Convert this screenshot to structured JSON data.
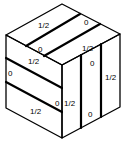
{
  "diagram": {
    "type": "isometric-cube",
    "stroke_color": "#000000",
    "background": "#ffffff",
    "faces": {
      "top": {
        "labels": [
          {
            "text": "1/2",
            "x": 38,
            "y": 28
          },
          {
            "text": "0",
            "x": 84,
            "y": 25
          },
          {
            "text": "0",
            "x": 38,
            "y": 52
          },
          {
            "text": "1/2",
            "x": 82,
            "y": 51
          },
          {
            "text": "1/2",
            "x": 28,
            "y": 64
          }
        ]
      },
      "left": {
        "labels": [
          {
            "text": "0",
            "x": 8,
            "y": 76
          },
          {
            "text": "0",
            "x": 55,
            "y": 106
          },
          {
            "text": "1/2",
            "x": 30,
            "y": 114
          }
        ]
      },
      "right": {
        "labels": [
          {
            "text": "0",
            "x": 90,
            "y": 66
          },
          {
            "text": "1/2",
            "x": 64,
            "y": 106
          },
          {
            "text": "1/2",
            "x": 105,
            "y": 80
          },
          {
            "text": "0",
            "x": 88,
            "y": 117
          }
        ]
      }
    }
  }
}
